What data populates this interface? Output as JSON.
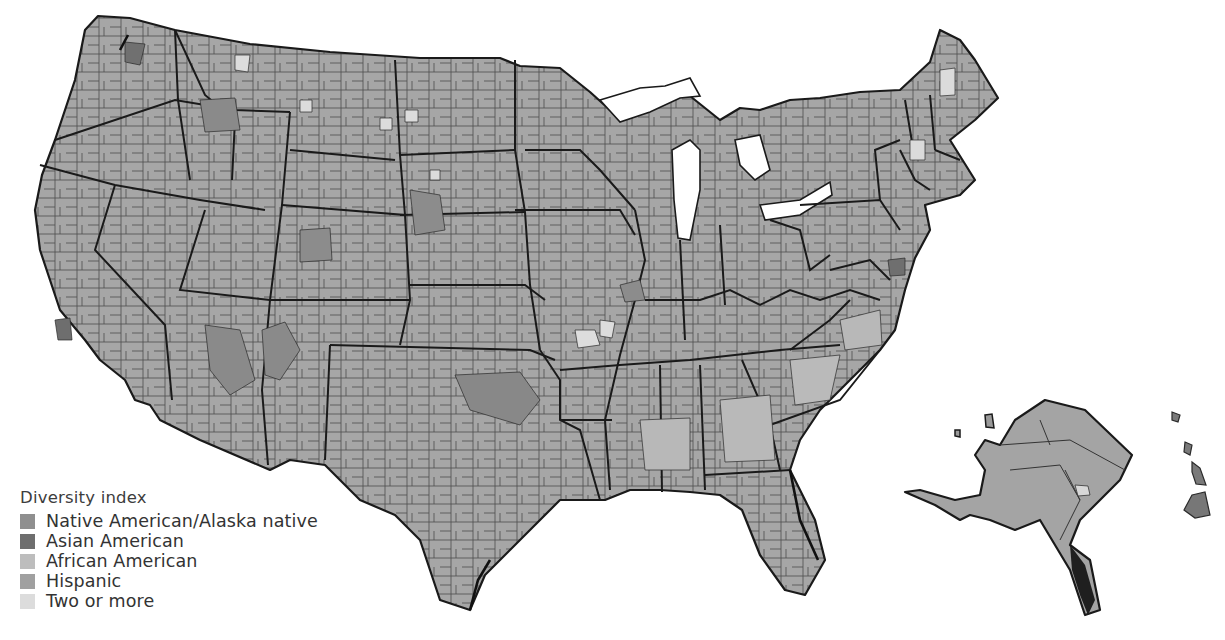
{
  "map": {
    "subject": "United States counties",
    "projection": "contiguous US with Alaska and Hawaii insets",
    "base_color": "#a3a3a3",
    "border_color": "#1a1a1a",
    "background": "#ffffff"
  },
  "legend": {
    "title": "Diversity index",
    "items": [
      {
        "label": "Native American/Alaska native",
        "color": "#8f8f8f"
      },
      {
        "label": "Asian American",
        "color": "#6e6e6e"
      },
      {
        "label": "African American",
        "color": "#bdbdbd"
      },
      {
        "label": "Hispanic",
        "color": "#a0a0a0"
      },
      {
        "label": "Two or more",
        "color": "#dcdcdc"
      }
    ]
  }
}
